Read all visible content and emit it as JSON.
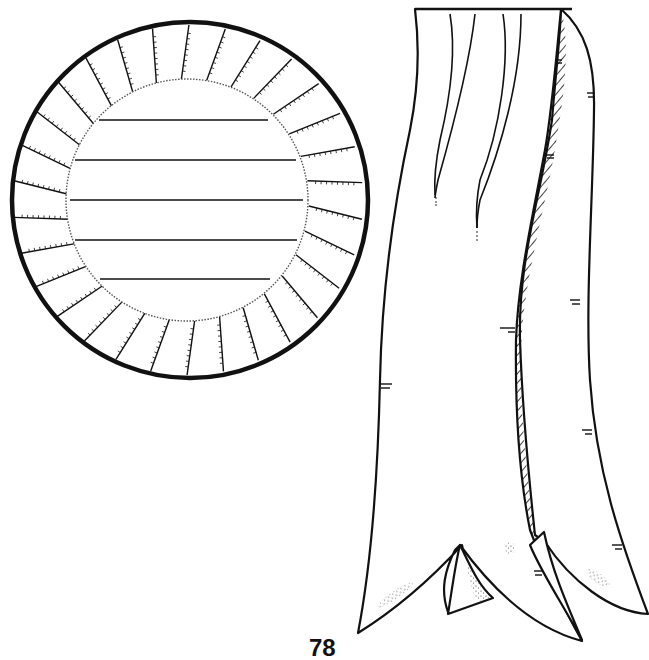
{
  "page": {
    "type": "coloring-page line art",
    "background_color": "#ffffff",
    "ink_color": "#111111",
    "page_number": "78"
  },
  "rosette": {
    "description": "circular award rosette with pleated ruffle border",
    "pleat_count": 30,
    "writing_lines": 5
  },
  "ribbon": {
    "description": "long hanging ribbon with two forked tails and hatched fold shading",
    "tails": 2
  }
}
